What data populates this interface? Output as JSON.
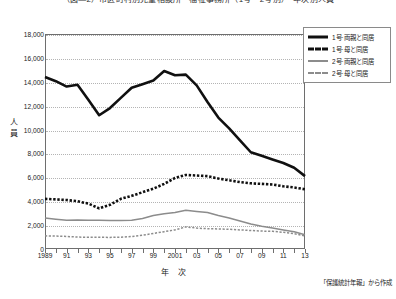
{
  "title": "（図―2）市区町村別児童相談所・福祉事務所（1号・2号別）・年次別人員",
  "axis": {
    "y_label": "人員",
    "x_label": "年  次",
    "y_ticks": [
      "18,000",
      "16,000",
      "14,000",
      "12,000",
      "10,000",
      "8,000",
      "6,000",
      "4,000",
      "2,000",
      "0"
    ],
    "x_ticks": [
      "1989",
      "91",
      "93",
      "95",
      "97",
      "99",
      "2001",
      "03",
      "05",
      "07",
      "09",
      "11",
      "13"
    ]
  },
  "legend": {
    "items": [
      {
        "label": "1号·両親と同居",
        "style": "solid-thick",
        "color": "#101010"
      },
      {
        "label": "1号·母と同居",
        "style": "dash-thick",
        "color": "#101010"
      },
      {
        "label": "2号·両親と同居",
        "style": "solid-gray",
        "color": "#8c8c8c"
      },
      {
        "label": "2号·母と同居",
        "style": "dash-gray",
        "color": "#8c8c8c"
      }
    ]
  },
  "source_note": "「保護統計年報」から作成",
  "chart_data": {
    "type": "line",
    "title": "（図―2）市区町村別児童相談所・福祉事務所（1号・2号別）・年次別人員",
    "xlabel": "年  次",
    "ylabel": "人員",
    "ylim": [
      0,
      18000
    ],
    "ytick_step": 2000,
    "grid": true,
    "legend_position": "top-right-outside",
    "x": [
      1989,
      1990,
      1991,
      1992,
      1993,
      1994,
      1995,
      1996,
      1997,
      1998,
      1999,
      2000,
      2001,
      2002,
      2003,
      2004,
      2005,
      2006,
      2007,
      2008,
      2009,
      2010,
      2011,
      2012,
      2013
    ],
    "x_tick_labels": [
      "1989",
      "91",
      "93",
      "95",
      "97",
      "99",
      "2001",
      "03",
      "05",
      "07",
      "09",
      "11",
      "13"
    ],
    "series": [
      {
        "name": "1号·両親と同居",
        "style": "solid-thick",
        "color": "#101010",
        "values": [
          14400,
          14050,
          13600,
          13750,
          12500,
          11200,
          11800,
          12650,
          13500,
          13800,
          14100,
          14900,
          14550,
          14600,
          13700,
          12300,
          11000,
          10100,
          9100,
          8100,
          7800,
          7500,
          7200,
          6800,
          6100
        ]
      },
      {
        "name": "1号·母と同居",
        "style": "dash-thick",
        "color": "#101010",
        "values": [
          4200,
          4150,
          4100,
          4000,
          3800,
          3400,
          3700,
          4200,
          4450,
          4750,
          5050,
          5450,
          5950,
          6200,
          6150,
          6100,
          5900,
          5750,
          5600,
          5500,
          5450,
          5400,
          5250,
          5150,
          5000
        ]
      },
      {
        "name": "2号·両親と同居",
        "style": "solid-gray",
        "color": "#8c8c8c",
        "values": [
          2600,
          2500,
          2400,
          2420,
          2400,
          2400,
          2380,
          2380,
          2400,
          2550,
          2800,
          2950,
          3050,
          3250,
          3150,
          3050,
          2800,
          2600,
          2350,
          2100,
          1900,
          1750,
          1600,
          1450,
          1200
        ]
      },
      {
        "name": "2号·母と同居",
        "style": "dash-gray",
        "color": "#8c8c8c",
        "values": [
          1100,
          1080,
          1050,
          1000,
          980,
          980,
          970,
          990,
          1050,
          1150,
          1300,
          1450,
          1600,
          1850,
          1750,
          1700,
          1680,
          1650,
          1600,
          1550,
          1500,
          1480,
          1400,
          1280,
          1100
        ]
      }
    ]
  }
}
